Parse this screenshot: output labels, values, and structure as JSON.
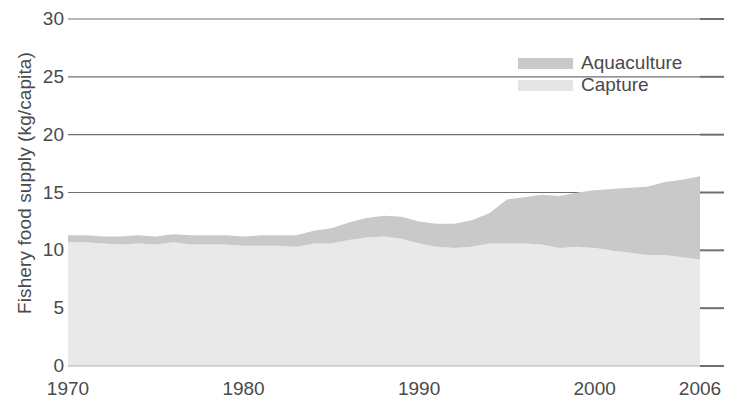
{
  "chart_data": {
    "type": "area",
    "stacked": true,
    "title": "",
    "xlabel": "",
    "ylabel": "Fishery food supply (kg/capita)",
    "xlim": [
      1970,
      2006
    ],
    "ylim": [
      0,
      30
    ],
    "ytick_labels": [
      "30",
      "25",
      "20",
      "15",
      "10",
      "5",
      "0"
    ],
    "ytick_values": [
      30,
      25,
      20,
      15,
      10,
      5,
      0
    ],
    "xtick_labels": [
      "1970",
      "1980",
      "1990",
      "2000",
      "2006"
    ],
    "xtick_values": [
      1970,
      1980,
      1990,
      2000,
      2006
    ],
    "grid": "horizontal",
    "legend_position": "top-right",
    "x": [
      1970,
      1971,
      1972,
      1973,
      1974,
      1975,
      1976,
      1977,
      1978,
      1979,
      1980,
      1981,
      1982,
      1983,
      1984,
      1985,
      1986,
      1987,
      1988,
      1989,
      1990,
      1991,
      1992,
      1993,
      1994,
      1995,
      1996,
      1997,
      1998,
      1999,
      2000,
      2001,
      2002,
      2003,
      2004,
      2005,
      2006
    ],
    "series": [
      {
        "name": "Capture",
        "color": "#e9e9e9",
        "values": [
          10.7,
          10.7,
          10.6,
          10.5,
          10.6,
          10.5,
          10.7,
          10.5,
          10.5,
          10.5,
          10.4,
          10.4,
          10.4,
          10.3,
          10.6,
          10.6,
          10.9,
          11.1,
          11.2,
          11.0,
          10.6,
          10.3,
          10.2,
          10.3,
          10.6,
          10.6,
          10.6,
          10.5,
          10.2,
          10.3,
          10.2,
          10.0,
          9.8,
          9.6,
          9.6,
          9.4,
          9.2
        ]
      },
      {
        "name": "Aquaculture",
        "color": "#c9c9c9",
        "values": [
          0.6,
          0.6,
          0.6,
          0.7,
          0.7,
          0.7,
          0.7,
          0.8,
          0.8,
          0.8,
          0.8,
          0.9,
          0.9,
          1.0,
          1.1,
          1.3,
          1.5,
          1.7,
          1.8,
          1.9,
          1.9,
          2.0,
          2.1,
          2.3,
          2.6,
          3.8,
          4.0,
          4.3,
          4.5,
          4.7,
          5.0,
          5.3,
          5.6,
          5.9,
          6.3,
          6.7,
          7.2
        ]
      }
    ],
    "totals": [
      11.3,
      11.3,
      11.2,
      11.2,
      11.3,
      11.2,
      11.4,
      11.3,
      11.3,
      11.3,
      11.2,
      11.3,
      11.3,
      11.3,
      11.7,
      11.9,
      12.4,
      12.8,
      13.0,
      12.9,
      12.5,
      12.3,
      12.3,
      12.6,
      13.2,
      14.4,
      14.6,
      14.8,
      14.7,
      15.0,
      15.2,
      15.3,
      15.4,
      15.5,
      15.9,
      16.1,
      16.4
    ]
  },
  "legend": {
    "items": [
      {
        "label": "Aquaculture",
        "color": "#c9c9c9"
      },
      {
        "label": "Capture",
        "color": "#e5e5e5"
      }
    ]
  },
  "axes": {
    "y_title": "Fishery food supply (kg/capita)"
  }
}
